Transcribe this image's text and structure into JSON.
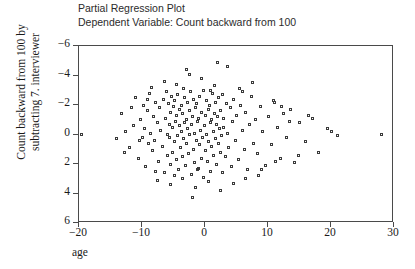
{
  "title": {
    "line1": "Partial Regression Plot",
    "line2": "Dependent Variable: Count backward from 100"
  },
  "axes": {
    "xlabel": "age",
    "ylabel_line1": "Count backward from 100 by",
    "ylabel_line2": "subtracting 7. interviewer",
    "xticks": [
      "−20",
      "−10",
      "0",
      "10",
      "20",
      "30"
    ],
    "yticks": [
      "6",
      "4",
      "2",
      "0",
      "−2",
      "−4",
      "−6"
    ]
  },
  "chart_data": {
    "type": "scatter",
    "title": "Partial Regression Plot",
    "subtitle": "Dependent Variable: Count backward from 100",
    "xlabel": "age",
    "ylabel": "Count backward from 100 by subtracting 7. interviewer",
    "xlim": [
      -20,
      30
    ],
    "ylim": [
      -6,
      6
    ],
    "xticks": [
      -20,
      -10,
      0,
      10,
      20,
      30
    ],
    "yticks": [
      -6,
      -4,
      -2,
      0,
      2,
      4,
      6
    ],
    "grid": false,
    "legend": null,
    "marker": "open-square",
    "marker_color": "#3a3a3a",
    "n_points": 430,
    "points": [
      [
        -19.6,
        0.0
      ],
      [
        -14.0,
        -0.3
      ],
      [
        -13.2,
        1.4
      ],
      [
        -12.6,
        0.2
      ],
      [
        -12.0,
        -0.9
      ],
      [
        -11.4,
        0.6
      ],
      [
        -11.0,
        2.5
      ],
      [
        -10.6,
        -1.6
      ],
      [
        -10.2,
        1.0
      ],
      [
        -10.0,
        -0.2
      ],
      [
        -9.8,
        2.0
      ],
      [
        -9.6,
        0.4
      ],
      [
        -9.4,
        -2.2
      ],
      [
        -9.2,
        1.6
      ],
      [
        -9.0,
        -0.6
      ],
      [
        -8.8,
        2.8
      ],
      [
        -8.6,
        0.1
      ],
      [
        -8.4,
        -1.1
      ],
      [
        -8.2,
        1.2
      ],
      [
        -8.0,
        -0.4
      ],
      [
        -7.8,
        2.2
      ],
      [
        -7.6,
        0.8
      ],
      [
        -7.4,
        -1.8
      ],
      [
        -7.2,
        1.8
      ],
      [
        -7.0,
        0.3
      ],
      [
        -6.8,
        -0.8
      ],
      [
        -6.6,
        2.4
      ],
      [
        -6.4,
        -2.6
      ],
      [
        -6.2,
        1.1
      ],
      [
        -6.0,
        0.0
      ],
      [
        -5.9,
        -1.4
      ],
      [
        -5.8,
        2.1
      ],
      [
        -5.7,
        0.7
      ],
      [
        -5.6,
        -0.2
      ],
      [
        -5.5,
        1.5
      ],
      [
        -5.4,
        -2.0
      ],
      [
        -5.3,
        2.6
      ],
      [
        -5.2,
        0.5
      ],
      [
        -5.1,
        -1.2
      ],
      [
        -5.0,
        1.9
      ],
      [
        -4.9,
        -0.5
      ],
      [
        -4.8,
        2.3
      ],
      [
        -4.7,
        0.9
      ],
      [
        -4.6,
        -1.7
      ],
      [
        -4.5,
        1.3
      ],
      [
        -4.4,
        -0.1
      ],
      [
        -4.3,
        2.7
      ],
      [
        -4.2,
        -2.4
      ],
      [
        -4.1,
        0.6
      ],
      [
        -4.0,
        1.7
      ],
      [
        -3.9,
        -0.9
      ],
      [
        -3.8,
        2.0
      ],
      [
        -3.7,
        0.2
      ],
      [
        -3.6,
        -1.5
      ],
      [
        -3.5,
        1.4
      ],
      [
        -3.4,
        -0.3
      ],
      [
        -3.3,
        2.5
      ],
      [
        -3.2,
        0.8
      ],
      [
        -3.1,
        -2.1
      ],
      [
        -3.0,
        1.0
      ],
      [
        -2.9,
        -0.6
      ],
      [
        -2.8,
        2.2
      ],
      [
        -2.7,
        0.4
      ],
      [
        -2.6,
        -1.3
      ],
      [
        -2.5,
        1.6
      ],
      [
        -2.4,
        -0.0
      ],
      [
        -2.3,
        2.9
      ],
      [
        -2.2,
        -2.7
      ],
      [
        -2.1,
        0.7
      ],
      [
        -2.0,
        1.2
      ],
      [
        -1.9,
        -1.0
      ],
      [
        -1.8,
        2.4
      ],
      [
        -1.7,
        0.1
      ],
      [
        -1.6,
        -1.9
      ],
      [
        -1.5,
        1.8
      ],
      [
        -1.4,
        -0.4
      ],
      [
        -1.3,
        2.1
      ],
      [
        -1.2,
        0.9
      ],
      [
        -1.1,
        -2.3
      ],
      [
        -1.0,
        1.1
      ],
      [
        -0.9,
        -0.7
      ],
      [
        -0.8,
        2.6
      ],
      [
        -0.7,
        0.3
      ],
      [
        -0.6,
        -1.6
      ],
      [
        -0.5,
        1.5
      ],
      [
        -0.4,
        -0.2
      ],
      [
        -0.3,
        3.0
      ],
      [
        -0.2,
        -2.9
      ],
      [
        -0.1,
        0.6
      ],
      [
        0.0,
        1.3
      ],
      [
        0.1,
        -1.1
      ],
      [
        0.2,
        2.3
      ],
      [
        0.3,
        0.0
      ],
      [
        0.4,
        -1.8
      ],
      [
        0.5,
        1.7
      ],
      [
        0.6,
        -0.5
      ],
      [
        0.7,
        2.0
      ],
      [
        0.8,
        0.8
      ],
      [
        0.9,
        -2.5
      ],
      [
        1.0,
        1.0
      ],
      [
        1.1,
        -0.8
      ],
      [
        1.2,
        2.8
      ],
      [
        1.3,
        0.2
      ],
      [
        1.4,
        -1.4
      ],
      [
        1.5,
        1.4
      ],
      [
        1.6,
        -0.3
      ],
      [
        1.7,
        2.2
      ],
      [
        1.8,
        0.7
      ],
      [
        1.9,
        -2.0
      ],
      [
        2.0,
        1.2
      ],
      [
        2.1,
        -0.6
      ],
      [
        2.2,
        2.5
      ],
      [
        2.3,
        0.4
      ],
      [
        2.4,
        -1.2
      ],
      [
        2.5,
        1.6
      ],
      [
        2.6,
        -0.1
      ],
      [
        2.7,
        2.7
      ],
      [
        2.8,
        -2.6
      ],
      [
        2.9,
        0.5
      ],
      [
        3.0,
        1.1
      ],
      [
        3.2,
        -1.5
      ],
      [
        3.4,
        2.1
      ],
      [
        3.6,
        0.1
      ],
      [
        3.8,
        -0.9
      ],
      [
        4.0,
        1.8
      ],
      [
        4.2,
        -2.2
      ],
      [
        4.4,
        0.9
      ],
      [
        4.6,
        2.4
      ],
      [
        4.8,
        -0.4
      ],
      [
        5.0,
        1.3
      ],
      [
        5.3,
        -1.7
      ],
      [
        5.6,
        2.0
      ],
      [
        5.9,
        0.3
      ],
      [
        6.2,
        -1.0
      ],
      [
        6.5,
        1.5
      ],
      [
        6.8,
        -2.4
      ],
      [
        7.1,
        0.7
      ],
      [
        7.4,
        2.6
      ],
      [
        7.7,
        -0.6
      ],
      [
        8.0,
        1.0
      ],
      [
        8.4,
        -1.3
      ],
      [
        8.8,
        1.9
      ],
      [
        9.2,
        0.2
      ],
      [
        9.6,
        -2.1
      ],
      [
        10.0,
        1.2
      ],
      [
        10.5,
        -0.7
      ],
      [
        11.0,
        2.2
      ],
      [
        11.5,
        0.5
      ],
      [
        12.0,
        -1.6
      ],
      [
        12.5,
        1.4
      ],
      [
        13.0,
        -0.2
      ],
      [
        13.6,
        1.7
      ],
      [
        14.2,
        -1.9
      ],
      [
        15.0,
        0.8
      ],
      [
        16.0,
        -0.5
      ],
      [
        17.0,
        1.1
      ],
      [
        18.0,
        -1.2
      ],
      [
        19.5,
        0.4
      ],
      [
        20.0,
        0.2
      ],
      [
        21.0,
        -0.1
      ],
      [
        28.0,
        0.0
      ],
      [
        -8.5,
        3.2
      ],
      [
        -6.5,
        3.6
      ],
      [
        -4.5,
        3.4
      ],
      [
        -2.5,
        4.1
      ],
      [
        -0.5,
        3.8
      ],
      [
        1.5,
        3.3
      ],
      [
        3.5,
        4.6
      ],
      [
        5.5,
        3.1
      ],
      [
        7.5,
        3.5
      ],
      [
        -7.5,
        -3.1
      ],
      [
        -5.5,
        -3.4
      ],
      [
        -3.5,
        -3.0
      ],
      [
        -1.5,
        -3.6
      ],
      [
        0.5,
        -3.2
      ],
      [
        2.5,
        -3.8
      ],
      [
        4.5,
        -3.3
      ],
      [
        6.5,
        -3.0
      ],
      [
        8.5,
        -2.8
      ],
      [
        -2.0,
        -4.3
      ],
      [
        2.0,
        4.9
      ],
      [
        -3.0,
        4.4
      ],
      [
        6.0,
        2.9
      ],
      [
        10.8,
        2.3
      ],
      [
        12.2,
        1.9
      ],
      [
        14.8,
        -1.4
      ],
      [
        16.5,
        1.3
      ],
      [
        9.0,
        -2.4
      ],
      [
        11.2,
        -1.8
      ],
      [
        13.4,
        0.9
      ],
      [
        -12.8,
        -1.2
      ],
      [
        -11.6,
        1.8
      ],
      [
        -10.4,
        -0.4
      ],
      [
        -9.1,
        2.4
      ],
      [
        -7.9,
        -2.5
      ],
      [
        -6.1,
        2.9
      ],
      [
        -4.9,
        -2.8
      ],
      [
        -3.4,
        3.1
      ],
      [
        -1.2,
        -2.4
      ],
      [
        0.8,
        3.0
      ]
    ]
  }
}
